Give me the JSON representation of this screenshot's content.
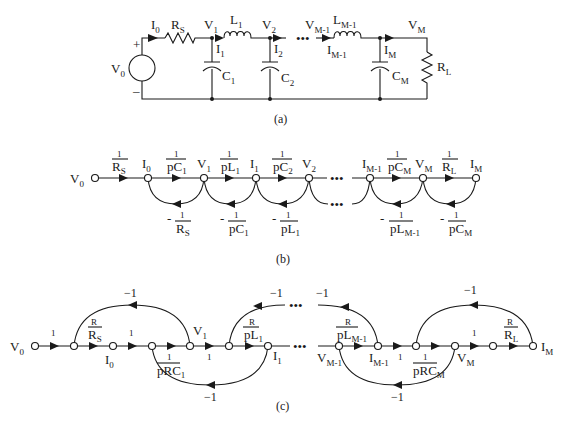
{
  "figure": {
    "panel_a": {
      "caption": "(a)",
      "source": {
        "label": "V",
        "sub": "0",
        "plus": "+",
        "minus": "–"
      },
      "labels": {
        "I0": {
          "t": "I",
          "s": "0"
        },
        "Rs": {
          "t": "R",
          "s": "S"
        },
        "V1": {
          "t": "V",
          "s": "1"
        },
        "L1": {
          "t": "L",
          "s": "1"
        },
        "V2": {
          "t": "V",
          "s": "2"
        },
        "I1": {
          "t": "I",
          "s": "1"
        },
        "I2": {
          "t": "I",
          "s": "2"
        },
        "C1": {
          "t": "C",
          "s": "1"
        },
        "C2": {
          "t": "C",
          "s": "2"
        },
        "VM1": {
          "t": "V",
          "s": "M-1"
        },
        "LM1": {
          "t": "L",
          "s": "M-1"
        },
        "IM1": {
          "t": "I",
          "s": "M-1"
        },
        "VM": {
          "t": "V",
          "s": "M"
        },
        "IM": {
          "t": "I",
          "s": "M"
        },
        "CM": {
          "t": "C",
          "s": "M"
        },
        "RL": {
          "t": "R",
          "s": "L"
        }
      },
      "ellipsis": "•••"
    },
    "panel_b": {
      "caption": "(b)",
      "nodes": [
        {
          "t": "V",
          "s": "0"
        },
        {
          "t": "I",
          "s": "0"
        },
        {
          "t": "V",
          "s": "1"
        },
        {
          "t": "I",
          "s": "1"
        },
        {
          "t": "V",
          "s": "2"
        },
        {
          "t": "I",
          "s": "M-1"
        },
        {
          "t": "V",
          "s": "M"
        },
        {
          "t": "I",
          "s": "M"
        }
      ],
      "forward_gains": [
        {
          "num": "1",
          "den": "R",
          "den_sub": "S"
        },
        {
          "num": "1",
          "den": "pC",
          "den_sub": "1"
        },
        {
          "num": "1",
          "den": "pL",
          "den_sub": "1"
        },
        {
          "num": "1",
          "den": "pC",
          "den_sub": "2"
        },
        {
          "num": "1",
          "den": "pC",
          "den_sub": "M"
        },
        {
          "num": "1",
          "den": "R",
          "den_sub": "L"
        }
      ],
      "feedback_gains": [
        {
          "sign": "-",
          "num": "1",
          "den": "R",
          "den_sub": "S"
        },
        {
          "sign": "-",
          "num": "1",
          "den": "pC",
          "den_sub": "1"
        },
        {
          "sign": "-",
          "num": "1",
          "den": "pL",
          "den_sub": "1"
        },
        {
          "sign": "-",
          "num": "1",
          "den": "pL",
          "den_sub": "M-1"
        },
        {
          "sign": "-",
          "num": "1",
          "den": "pC",
          "den_sub": "M"
        }
      ],
      "ellipsis": "•••"
    },
    "panel_c": {
      "caption": "(c)",
      "nodes": [
        {
          "t": "V",
          "s": "0"
        },
        {
          "t": "I",
          "s": "0"
        },
        {
          "t": "V",
          "s": "1"
        },
        {
          "t": "I",
          "s": "1"
        },
        {
          "t": "V",
          "s": "M-1"
        },
        {
          "t": "I",
          "s": "M-1"
        },
        {
          "t": "V",
          "s": "M"
        },
        {
          "t": "I",
          "s": "M"
        }
      ],
      "unit_gain": "1",
      "neg_gain": "−1",
      "fractions": [
        {
          "num": "R",
          "den": "R",
          "den_sub": "S"
        },
        {
          "num": "1",
          "den": "pRC",
          "den_sub": "1"
        },
        {
          "num": "R",
          "den": "pL",
          "den_sub": "1"
        },
        {
          "num": "R",
          "den": "pL",
          "den_sub": "M-1"
        },
        {
          "num": "1",
          "den": "pRC",
          "den_sub": "M"
        },
        {
          "num": "R",
          "den": "R",
          "den_sub": "L"
        }
      ],
      "ellipsis": "•••"
    }
  }
}
